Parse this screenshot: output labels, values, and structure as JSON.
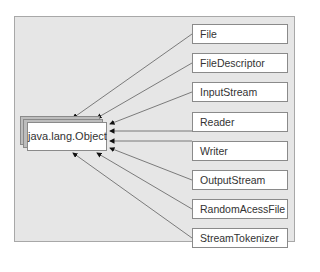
{
  "diagram": {
    "root": {
      "label": "java.lang.Object"
    },
    "subclasses": [
      {
        "label": "File"
      },
      {
        "label": "FileDescriptor"
      },
      {
        "label": "InputStream"
      },
      {
        "label": "Reader"
      },
      {
        "label": "Writer"
      },
      {
        "label": "OutputStream"
      },
      {
        "label": "RandomAcessFile"
      },
      {
        "label": "StreamTokenizer"
      }
    ],
    "colors": {
      "background": "#e6e6e6",
      "box": "#ffffff",
      "line": "#6e6e6e",
      "border": "#8a8a8a"
    }
  }
}
